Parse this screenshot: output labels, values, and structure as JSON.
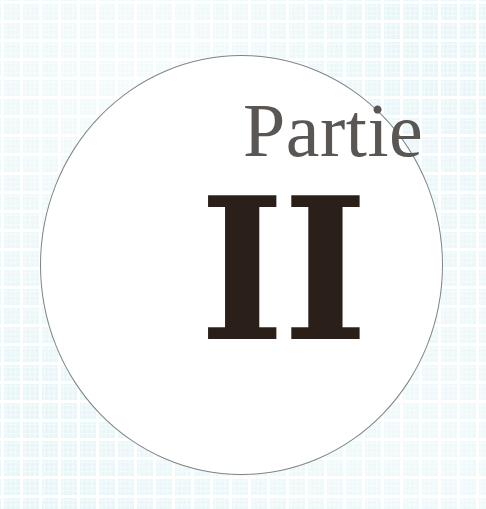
{
  "page": {
    "background_color": "#e9f6f8",
    "grid_line_color": "#ffffff",
    "width": 486,
    "height": 509
  },
  "plate": {
    "name": "decorative-circle",
    "shape": "circle",
    "fill_color": "#ffffff",
    "stroke_color": "#7f8486",
    "stroke_width_px": 1,
    "left": 40,
    "top": 55,
    "width": 403,
    "height": 420
  },
  "title": {
    "word": "Partie",
    "word_color": "#5a5654",
    "numeral": "II",
    "numeral_color": "#2b1f1a",
    "full_text": "Partie II",
    "language": "fr"
  }
}
